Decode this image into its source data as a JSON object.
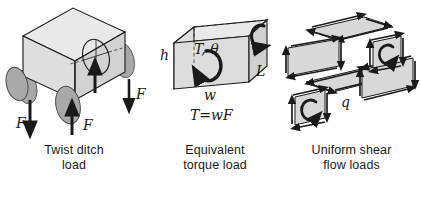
{
  "figure": {
    "background_color": "#ffffff",
    "line_color": "#1a1a1a",
    "face_color_top": "#e6e6e6",
    "face_color_front": "#d9d9d9",
    "face_color_side": "#cccccc",
    "wheel_color": "#a9a9a9",
    "panel_color": "#d6d6d6"
  },
  "panels": [
    {
      "id": "twist-ditch-load",
      "caption_line1": "Twist ditch",
      "caption_line2": "load",
      "labels": [
        {
          "name": "force-left-down",
          "text": "F"
        },
        {
          "name": "force-center-up",
          "text": "F"
        },
        {
          "name": "force-right-down",
          "text": "F"
        }
      ]
    },
    {
      "id": "equivalent-torque-load",
      "caption_line1": "Equivalent",
      "caption_line2": "torque load",
      "labels": [
        {
          "name": "height-label",
          "text": "h"
        },
        {
          "name": "torque-angle-label",
          "text": "T, θ"
        },
        {
          "name": "width-label",
          "text": "w"
        },
        {
          "name": "length-label",
          "text": "L"
        },
        {
          "name": "torque-equation",
          "text": "T=wF"
        }
      ]
    },
    {
      "id": "uniform-shear-flow-loads",
      "caption_line1": "Uniform shear",
      "caption_line2": "flow loads",
      "labels": [
        {
          "name": "shear-flow-label",
          "text": "q"
        }
      ]
    }
  ]
}
